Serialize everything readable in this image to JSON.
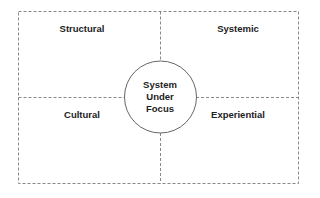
{
  "diagram": {
    "quadrants": [
      {
        "position": "top-left",
        "label": "Structural"
      },
      {
        "position": "top-right",
        "label": "Systemic"
      },
      {
        "position": "bottom-left",
        "label": "Cultural"
      },
      {
        "position": "bottom-right",
        "label": "Experiential"
      }
    ],
    "center": {
      "lines": [
        "System",
        "Under",
        "Focus"
      ]
    },
    "colors": {
      "stroke": "#777777",
      "text": "#222222"
    }
  }
}
